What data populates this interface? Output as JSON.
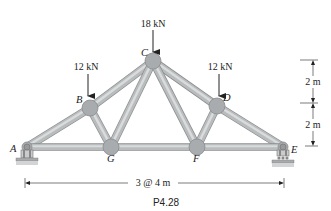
{
  "figure": {
    "caption": "P4.28",
    "colors": {
      "member_fill": "#b9bcbd",
      "member_edge": "#8a8d8f",
      "member_highlight": "#d9dbdc",
      "gusset_fill": "#a9acae",
      "support_base": "#9a9c9e",
      "ink": "#222222"
    },
    "joints": [
      {
        "id": "A",
        "label": "A",
        "x": 27,
        "y": 147
      },
      {
        "id": "B",
        "label": "B",
        "x": 90,
        "y": 108
      },
      {
        "id": "C",
        "label": "C",
        "x": 153,
        "y": 61
      },
      {
        "id": "D",
        "label": "D",
        "x": 217,
        "y": 106
      },
      {
        "id": "E",
        "label": "E",
        "x": 283,
        "y": 147
      },
      {
        "id": "F",
        "label": "F",
        "x": 197,
        "y": 147
      },
      {
        "id": "G",
        "label": "G",
        "x": 111,
        "y": 147
      }
    ],
    "members": [
      [
        "A",
        "B"
      ],
      [
        "B",
        "C"
      ],
      [
        "C",
        "D"
      ],
      [
        "D",
        "E"
      ],
      [
        "A",
        "G"
      ],
      [
        "G",
        "F"
      ],
      [
        "F",
        "E"
      ],
      [
        "B",
        "G"
      ],
      [
        "G",
        "C"
      ],
      [
        "C",
        "F"
      ],
      [
        "F",
        "D"
      ]
    ],
    "loads": [
      {
        "joint": "C",
        "label": "18 kN",
        "magnitude_kN": 18,
        "direction": "down"
      },
      {
        "joint": "B",
        "label": "12 kN",
        "magnitude_kN": 12,
        "direction": "down"
      },
      {
        "joint": "D",
        "label": "12 kN",
        "magnitude_kN": 12,
        "direction": "down"
      }
    ],
    "supports": [
      {
        "joint": "A",
        "type": "pin"
      },
      {
        "joint": "E",
        "type": "roller"
      }
    ],
    "dimensions": {
      "vertical": [
        {
          "label": "2 m",
          "from": "C",
          "to": "D"
        },
        {
          "label": "2 m",
          "from": "D",
          "to": "E"
        }
      ],
      "horizontal": {
        "label": "3 @ 4 m",
        "from": "A",
        "to": "E"
      }
    }
  }
}
